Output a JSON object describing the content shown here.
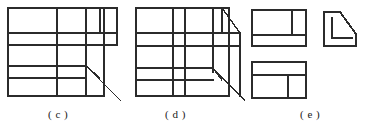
{
  "page": {
    "background_color": "#ffffff",
    "stroke_color": "#2b2b2b",
    "width": 367,
    "height": 132
  },
  "captions": {
    "c": "( c )",
    "d": "( d )",
    "e": "( e )"
  },
  "figures": [
    {
      "id": "figure-c",
      "label": "( c )",
      "kind": "line-drawing",
      "description": "Grid of rectangles with a receding diagonal at lower right forming a stepped pictorial view",
      "strokes": [
        {
          "name": "c-outer-rect-left",
          "type": "rect",
          "x": 8,
          "y": 8,
          "w": 96,
          "h": 88
        },
        {
          "name": "c-vertical-divider",
          "type": "line",
          "x1": 57,
          "y1": 8,
          "x2": 57,
          "y2": 96
        },
        {
          "name": "c-vertical-right-1",
          "type": "line",
          "x1": 86,
          "y1": 8,
          "x2": 86,
          "y2": 96
        },
        {
          "name": "c-vertical-right-2",
          "type": "line",
          "x1": 100,
          "y1": 8,
          "x2": 100,
          "y2": 33
        },
        {
          "name": "c-horizontal-1",
          "type": "line",
          "x1": 8,
          "y1": 33,
          "x2": 117,
          "y2": 33
        },
        {
          "name": "c-horizontal-2",
          "type": "line",
          "x1": 8,
          "y1": 45,
          "x2": 117,
          "y2": 45
        },
        {
          "name": "c-horizontal-3",
          "type": "line",
          "x1": 8,
          "y1": 66,
          "x2": 86,
          "y2": 66
        },
        {
          "name": "c-horizontal-4",
          "type": "line",
          "x1": 8,
          "y1": 78,
          "x2": 86,
          "y2": 78
        },
        {
          "name": "c-step-top",
          "type": "line",
          "x1": 100,
          "y1": 8,
          "x2": 117,
          "y2": 8
        },
        {
          "name": "c-step-right-edge",
          "type": "line",
          "x1": 117,
          "y1": 8,
          "x2": 117,
          "y2": 45
        },
        {
          "name": "c-diagonal-upper",
          "type": "line",
          "x1": 86,
          "y1": 66,
          "x2": 100,
          "y2": 78
        },
        {
          "name": "c-diagonal-lower",
          "type": "line",
          "x1": 86,
          "y1": 66,
          "x2": 121,
          "y2": 101
        }
      ]
    },
    {
      "id": "figure-d",
      "label": "( d )",
      "kind": "line-drawing",
      "description": "Grid of rectangles with two receding diagonals at the right forming a chamfered pictorial view",
      "strokes": [
        {
          "name": "d-outer-rect",
          "type": "rect",
          "x": 136,
          "y": 8,
          "w": 93,
          "h": 88
        },
        {
          "name": "d-vertical-1",
          "type": "line",
          "x1": 173,
          "y1": 8,
          "x2": 173,
          "y2": 96
        },
        {
          "name": "d-vertical-2",
          "type": "line",
          "x1": 185,
          "y1": 8,
          "x2": 185,
          "y2": 96
        },
        {
          "name": "d-vertical-3",
          "type": "line",
          "x1": 213,
          "y1": 8,
          "x2": 213,
          "y2": 72
        },
        {
          "name": "d-vertical-4",
          "type": "line",
          "x1": 222,
          "y1": 8,
          "x2": 222,
          "y2": 33
        },
        {
          "name": "d-horizontal-1",
          "type": "line",
          "x1": 136,
          "y1": 33,
          "x2": 240,
          "y2": 33
        },
        {
          "name": "d-horizontal-2",
          "type": "line",
          "x1": 136,
          "y1": 46,
          "x2": 240,
          "y2": 46
        },
        {
          "name": "d-horizontal-3",
          "type": "line",
          "x1": 136,
          "y1": 68,
          "x2": 213,
          "y2": 68
        },
        {
          "name": "d-horizontal-4",
          "type": "line",
          "x1": 136,
          "y1": 80,
          "x2": 213,
          "y2": 80
        },
        {
          "name": "d-chamfer-top",
          "type": "line",
          "x1": 222,
          "y1": 8,
          "x2": 240,
          "y2": 33
        },
        {
          "name": "d-right-edge",
          "type": "line",
          "x1": 240,
          "y1": 33,
          "x2": 240,
          "y2": 96
        },
        {
          "name": "d-diagonal-inner",
          "type": "line",
          "x1": 213,
          "y1": 68,
          "x2": 222,
          "y2": 80
        },
        {
          "name": "d-diagonal-outer",
          "type": "line",
          "x1": 213,
          "y1": 68,
          "x2": 245,
          "y2": 101
        }
      ]
    },
    {
      "id": "figure-e",
      "label": "( e )",
      "kind": "line-drawing",
      "description": "Three orthographic views: top view, right side view with chamfer, and front view",
      "views": [
        {
          "name": "e-top-view",
          "description": "Upper-left rectangle divided by one vertical line near right and one horizontal line near bottom",
          "strokes": [
            {
              "name": "e1-outer-rect",
              "type": "rect",
              "x": 252,
              "y": 10,
              "w": 54,
              "h": 36
            },
            {
              "name": "e1-vertical",
              "type": "line",
              "x1": 292,
              "y1": 10,
              "x2": 292,
              "y2": 35
            },
            {
              "name": "e1-horizontal",
              "type": "line",
              "x1": 252,
              "y1": 35,
              "x2": 306,
              "y2": 35
            }
          ]
        },
        {
          "name": "e-side-view",
          "description": "L-shaped profile with 45 degree chamfer at the upper right",
          "strokes": [
            {
              "name": "e2-profile-outline",
              "type": "polygon",
              "points": "324,12 340,12 356,34 356,46 324,46"
            },
            {
              "name": "e2-inner-notch",
              "type": "polyline",
              "points": "332,18 332,38 352,38"
            }
          ]
        },
        {
          "name": "e-front-view",
          "description": "Lower rectangle divided by one horizontal line near top and one vertical line near right",
          "strokes": [
            {
              "name": "e3-outer-rect",
              "type": "rect",
              "x": 252,
              "y": 62,
              "w": 54,
              "h": 36
            },
            {
              "name": "e3-horizontal",
              "type": "line",
              "x1": 252,
              "y1": 75,
              "x2": 306,
              "y2": 75
            },
            {
              "name": "e3-vertical",
              "type": "line",
              "x1": 288,
              "y1": 75,
              "x2": 288,
              "y2": 98
            }
          ]
        }
      ]
    }
  ]
}
